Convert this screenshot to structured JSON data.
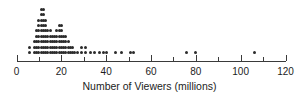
{
  "chart_data": {
    "type": "scatter",
    "plot_style": "dot-plot",
    "title": "",
    "xlabel": "Number of Viewers (millions)",
    "ylabel": "",
    "xlim": [
      0,
      120
    ],
    "grid": false,
    "legend": null,
    "x_major_ticks": [
      0,
      20,
      40,
      60,
      80,
      100,
      120
    ],
    "x_major_tick_labels": [
      "0",
      "20",
      "40",
      "60",
      "80",
      "100",
      "120"
    ],
    "x_minor_tick_interval": 10,
    "dot_color": "#2b2b2b",
    "axis_color": "#3a3a3a",
    "stacks": [
      {
        "value": 6,
        "count": 2
      },
      {
        "value": 8,
        "count": 3
      },
      {
        "value": 9,
        "count": 5
      },
      {
        "value": 10,
        "count": 7
      },
      {
        "value": 11,
        "count": 9
      },
      {
        "value": 12,
        "count": 9
      },
      {
        "value": 13,
        "count": 7
      },
      {
        "value": 14,
        "count": 5
      },
      {
        "value": 15,
        "count": 5
      },
      {
        "value": 16,
        "count": 4
      },
      {
        "value": 17,
        "count": 4
      },
      {
        "value": 18,
        "count": 5
      },
      {
        "value": 19,
        "count": 6
      },
      {
        "value": 20,
        "count": 6
      },
      {
        "value": 21,
        "count": 4
      },
      {
        "value": 22,
        "count": 4
      },
      {
        "value": 23,
        "count": 3
      },
      {
        "value": 24,
        "count": 2
      },
      {
        "value": 25,
        "count": 2
      },
      {
        "value": 26,
        "count": 1
      },
      {
        "value": 27,
        "count": 1
      },
      {
        "value": 29,
        "count": 2
      },
      {
        "value": 31,
        "count": 2
      },
      {
        "value": 33,
        "count": 1
      },
      {
        "value": 35,
        "count": 1
      },
      {
        "value": 37,
        "count": 1
      },
      {
        "value": 39,
        "count": 1
      },
      {
        "value": 40,
        "count": 1
      },
      {
        "value": 44,
        "count": 1
      },
      {
        "value": 47,
        "count": 1
      },
      {
        "value": 51,
        "count": 1
      },
      {
        "value": 52,
        "count": 1
      },
      {
        "value": 76,
        "count": 1
      },
      {
        "value": 80,
        "count": 1
      },
      {
        "value": 106,
        "count": 1
      }
    ],
    "total_dots": 108
  },
  "axis": {
    "label": "Number of Viewers (millions)"
  }
}
